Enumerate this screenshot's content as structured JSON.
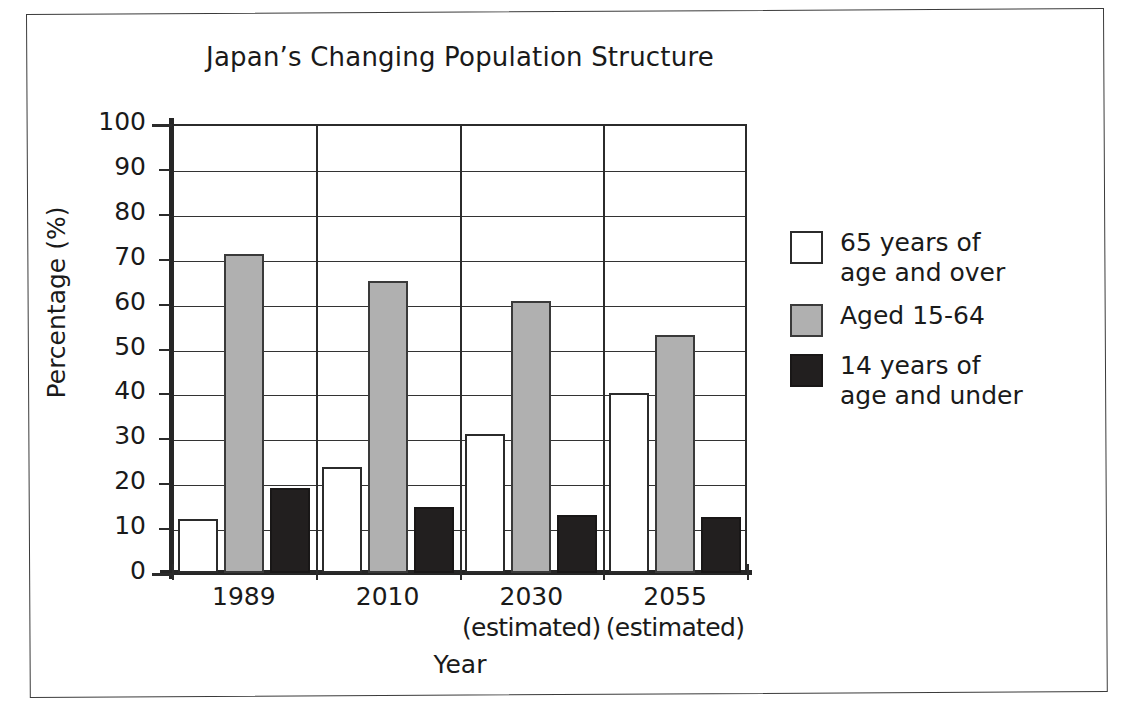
{
  "chart_data": {
    "type": "bar",
    "title": "Japan’s Changing Population Structure",
    "xlabel": "Year",
    "ylabel": "Percentage (%)",
    "ylim": [
      0,
      100
    ],
    "ytick_step": 10,
    "yticks": [
      0,
      10,
      20,
      30,
      40,
      50,
      60,
      70,
      80,
      90,
      100
    ],
    "ytick_labels": [
      "0",
      "10",
      "20",
      "30",
      "40",
      "50",
      "60",
      "70",
      "80",
      "90",
      "100"
    ],
    "grid": "horizontal-and-category-separators",
    "legend_position": "right",
    "categories": [
      "1989",
      "2010",
      "2030",
      "2055"
    ],
    "category_notes": [
      "",
      "",
      "(estimated)",
      "(estimated)"
    ],
    "series": [
      {
        "name": "65 years of\nage and over",
        "legend_label": "65 years of\nage and over",
        "color": "#ffffff",
        "values": [
          12,
          23.5,
          31,
          40
        ]
      },
      {
        "name": "Aged 15-64",
        "legend_label": "Aged 15-64",
        "color": "#b0b0b0",
        "values": [
          71,
          65,
          60.5,
          53
        ]
      },
      {
        "name": "14 years of\nage and under",
        "legend_label": "14 years of\nage and under",
        "color": "#221f1f",
        "values": [
          19,
          14.8,
          13,
          12.5
        ]
      }
    ]
  },
  "colors": {
    "axis": "#2b2b2b",
    "grid": "#333333",
    "text": "#1a1a1a",
    "series_over65": "#ffffff",
    "series_15to64": "#b0b0b0",
    "series_under14": "#221f1f",
    "page_border": "#3b3b3b"
  }
}
